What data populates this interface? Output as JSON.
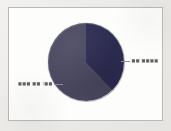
{
  "figure": {
    "panel_background": "#fdfdfc",
    "panel_border_color": "#b9b9b9",
    "outer_background": "#efeeec"
  },
  "chart_data": {
    "type": "pie",
    "title": "",
    "subtitle": "",
    "xlabel": "",
    "ylabel": "",
    "grid": false,
    "legend_position": "callout-labels",
    "labels": [
      "■■ ■■■■",
      "■■■ ■■ (■■"
    ],
    "values": [
      38,
      62
    ],
    "colors": [
      "#2d2c52",
      "#4a4961"
    ],
    "start_angle_deg": 0,
    "direction": "clockwise",
    "annotations": [
      {
        "name": "slice-label-right",
        "text": "■■ ■■■■",
        "points_to_slice": 0,
        "leader": "left"
      },
      {
        "name": "slice-label-left",
        "text": "■■■ ■■ (■■",
        "points_to_slice": 1,
        "leader": "right"
      }
    ]
  }
}
